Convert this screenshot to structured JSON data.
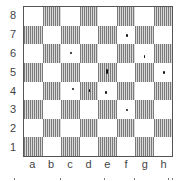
{
  "board": {
    "ranks": [
      "8",
      "7",
      "6",
      "5",
      "4",
      "3",
      "2",
      "1"
    ],
    "files": [
      "a",
      "b",
      "c",
      "d",
      "e",
      "f",
      "g",
      "h"
    ],
    "colors": {
      "light": "#ffffff",
      "dark_stripe_a": "#7a7a7a",
      "dark_stripe_b": "#d8d8d8",
      "border": "#555555"
    },
    "marks": [
      {
        "square": "f7",
        "col": 5,
        "row": 1,
        "dx": 9,
        "dy": 8,
        "w": 2,
        "h": 3
      },
      {
        "square": "c6",
        "col": 2,
        "row": 2,
        "dx": 9,
        "dy": 8,
        "w": 2,
        "h": 2
      },
      {
        "square": "g6",
        "col": 6,
        "row": 2,
        "dx": 9,
        "dy": 11,
        "w": 1,
        "h": 3
      },
      {
        "square": "e5",
        "col": 4,
        "row": 3,
        "dx": 8,
        "dy": 6,
        "w": 2,
        "h": 5
      },
      {
        "square": "h5",
        "col": 7,
        "row": 3,
        "dx": 9,
        "dy": 8,
        "w": 2,
        "h": 3
      },
      {
        "square": "c4",
        "col": 2,
        "row": 4,
        "dx": 11,
        "dy": 6,
        "w": 2,
        "h": 2
      },
      {
        "square": "d4",
        "col": 3,
        "row": 4,
        "dx": 9,
        "dy": 7,
        "w": 1,
        "h": 3
      },
      {
        "square": "e4",
        "col": 4,
        "row": 4,
        "dx": 7,
        "dy": 9,
        "w": 2,
        "h": 3
      },
      {
        "square": "f3",
        "col": 5,
        "row": 5,
        "dx": 9,
        "dy": 9,
        "w": 2,
        "h": 2
      }
    ]
  },
  "footer_dots_x": [
    14,
    60,
    104,
    134,
    168,
    172
  ]
}
